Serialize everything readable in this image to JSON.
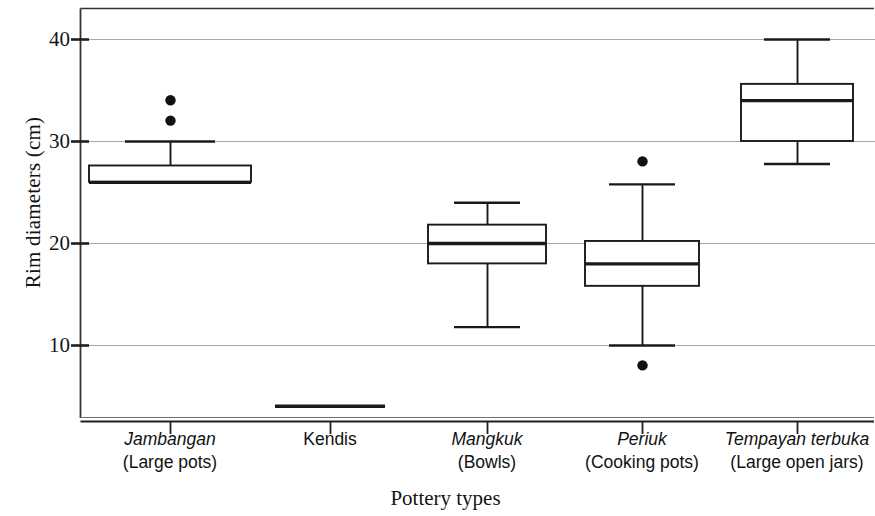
{
  "chart_data": {
    "type": "box",
    "title": "",
    "xlabel": "Pottery types",
    "ylabel": "Rim diameters (cm)",
    "ylim": [
      2,
      43
    ],
    "yticks": [
      10,
      20,
      30,
      40
    ],
    "ytick_labels": [
      "10",
      "20",
      "30",
      "40"
    ],
    "grid": true,
    "grid_axis": "y",
    "legend": "none",
    "categories": [
      "Jambangan (Large pots)",
      "Kendis",
      "Mangkuk (Bowls)",
      "Periuk (Cooking pots)",
      "Tempayan terbuka (Large open jars)"
    ],
    "boxes": [
      {
        "category": "Jambangan",
        "gloss": "(Large pots)",
        "whisker_low": 26,
        "q1": 26,
        "median": 26,
        "q3": 27.6,
        "whisker_high": 30,
        "outliers": [
          32,
          34
        ]
      },
      {
        "category": "Kendis",
        "gloss": "",
        "whisker_low": 4,
        "q1": 4,
        "median": 4,
        "q3": 4,
        "whisker_high": 4,
        "outliers": []
      },
      {
        "category": "Mangkuk",
        "gloss": "(Bowls)",
        "whisker_low": 11.8,
        "q1": 18,
        "median": 20,
        "q3": 21.8,
        "whisker_high": 24,
        "outliers": []
      },
      {
        "category": "Periuk",
        "gloss": "(Cooking pots)",
        "whisker_low": 10,
        "q1": 15.8,
        "median": 18,
        "q3": 20.2,
        "whisker_high": 25.8,
        "outliers": [
          8,
          28
        ]
      },
      {
        "category": "Tempayan terbuka",
        "gloss": "(Large open jars)",
        "whisker_low": 27.8,
        "q1": 30,
        "median": 34,
        "q3": 35.6,
        "whisker_high": 40,
        "outliers": []
      }
    ],
    "colors": {
      "line": "#1a1a1a",
      "grid": "#a8a8a8",
      "axis": "#2b2b2b",
      "box_fill": "#ffffff",
      "outlier": "#111111"
    }
  },
  "axis": {
    "x_title": "Pottery types",
    "y_title": "Rim diameters (cm)",
    "y_tick_labels": [
      "40",
      "30",
      "20",
      "10"
    ]
  },
  "category_labels": [
    {
      "native": "Jambangan",
      "gloss": "(Large pots)",
      "italic": true
    },
    {
      "native": "Kendis",
      "gloss": "",
      "italic": false
    },
    {
      "native": "Mangkuk",
      "gloss": "(Bowls)",
      "italic": true
    },
    {
      "native": "Periuk",
      "gloss": "(Cooking pots)",
      "italic": true
    },
    {
      "native": "Tempayan terbuka",
      "gloss": "(Large open jars)",
      "italic": true
    }
  ]
}
